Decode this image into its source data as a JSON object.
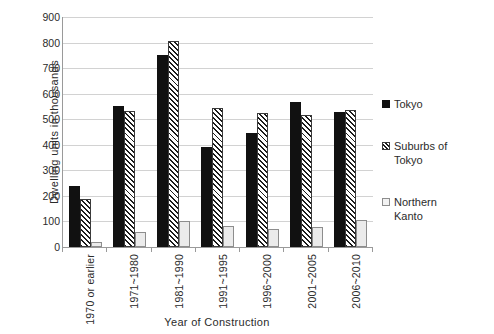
{
  "chart_data": {
    "type": "bar",
    "title": "",
    "xlabel": "Year of Construction",
    "ylabel": "Dwelling units  in  thousands",
    "ylim": [
      0,
      900
    ],
    "ytick_step": 100,
    "yticks": [
      900,
      800,
      700,
      600,
      500,
      400,
      300,
      200,
      100,
      0
    ],
    "grid": true,
    "legend_position": "right",
    "categories": [
      "1970 or earlier",
      "1971~1980",
      "1981~1990",
      "1991~1995",
      "1996~2000",
      "2001~2005",
      "2006~2010"
    ],
    "series": [
      {
        "name": "Tokyo",
        "color": "#111111",
        "fill": "solid-black",
        "values": [
          240,
          553,
          752,
          392,
          448,
          567,
          530
        ]
      },
      {
        "name": "Suburbs of Tokyo",
        "color": "#1c1c1c",
        "fill": "diagonal-hatch",
        "values": [
          189,
          533,
          808,
          543,
          525,
          515,
          537
        ]
      },
      {
        "name": "Northern Kanto",
        "color": "#ebebeb",
        "fill": "light-gray",
        "values": [
          20,
          58,
          100,
          83,
          72,
          80,
          105
        ]
      }
    ]
  },
  "legend": {
    "items": [
      {
        "label": "Tokyo",
        "series_key": "tokyo"
      },
      {
        "label": "Suburbs of\nTokyo",
        "label_line1": "Suburbs of",
        "label_line2": "Tokyo",
        "series_key": "suburbs"
      },
      {
        "label": "Northern\nKanto",
        "label_line1": "Northern",
        "label_line2": "Kanto",
        "series_key": "kanto"
      }
    ]
  }
}
